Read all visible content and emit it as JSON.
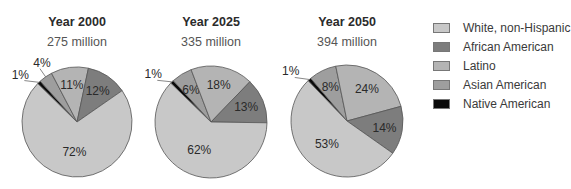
{
  "chart_data": [
    {
      "type": "pie",
      "title": "Year 2000",
      "subtitle": "275 million",
      "categories": [
        "Native American",
        "Asian American",
        "Latino",
        "African American",
        "White, non-Hispanic"
      ],
      "values": [
        1,
        4,
        11,
        12,
        72
      ],
      "labels": [
        "1%",
        "4%",
        "11%",
        "12%",
        "72%"
      ]
    },
    {
      "type": "pie",
      "title": "Year 2025",
      "subtitle": "335 million",
      "categories": [
        "Native American",
        "Asian American",
        "Latino",
        "African American",
        "White, non-Hispanic"
      ],
      "values": [
        1,
        6,
        18,
        13,
        62
      ],
      "labels": [
        "1%",
        "6%",
        "18%",
        "13%",
        "62%"
      ]
    },
    {
      "type": "pie",
      "title": "Year 2050",
      "subtitle": "394 million",
      "categories": [
        "Native American",
        "Asian American",
        "Latino",
        "African American",
        "White, non-Hispanic"
      ],
      "values": [
        1,
        8,
        24,
        14,
        53
      ],
      "labels": [
        "1%",
        "8%",
        "24%",
        "14%",
        "53%"
      ]
    }
  ],
  "legend": {
    "position": "right",
    "items": [
      {
        "label": "White, non-Hispanic",
        "color": "#c8c8c8"
      },
      {
        "label": "African American",
        "color": "#7d7d7d"
      },
      {
        "label": "Latino",
        "color": "#b4b4b4"
      },
      {
        "label": "Asian American",
        "color": "#9e9e9e"
      },
      {
        "label": "Native American",
        "color": "#0a0a0a"
      }
    ]
  },
  "colors": {
    "Native American": "#0a0a0a",
    "Asian American": "#9e9e9e",
    "Latino": "#b4b4b4",
    "African American": "#7d7d7d",
    "White, non-Hispanic": "#c8c8c8"
  }
}
